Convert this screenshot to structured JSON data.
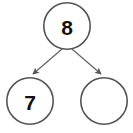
{
  "diagram": {
    "type": "binary-tree",
    "background_color": "#ffffff",
    "stroke_color": "#555555",
    "edge_color": "#666666",
    "text_color": "#111111",
    "node_radius": 24,
    "stroke_width": 1.6,
    "font_size": 20,
    "nodes": [
      {
        "id": "root",
        "label": "8",
        "cx": 67,
        "cy": 26,
        "r": 24,
        "empty": false
      },
      {
        "id": "left-child",
        "label": "7",
        "cx": 30,
        "cy": 101,
        "r": 24,
        "empty": false
      },
      {
        "id": "right-child",
        "label": "",
        "cx": 104,
        "cy": 101,
        "r": 24,
        "empty": true
      }
    ],
    "edges": [
      {
        "id": "root-to-left",
        "from": "root",
        "to": "left-child",
        "x1": 62,
        "y1": 49,
        "x2": 33,
        "y2": 74,
        "arrow": true
      },
      {
        "id": "root-to-right",
        "from": "root",
        "to": "right-child",
        "x1": 72,
        "y1": 49,
        "x2": 101,
        "y2": 74,
        "arrow": true
      }
    ]
  }
}
